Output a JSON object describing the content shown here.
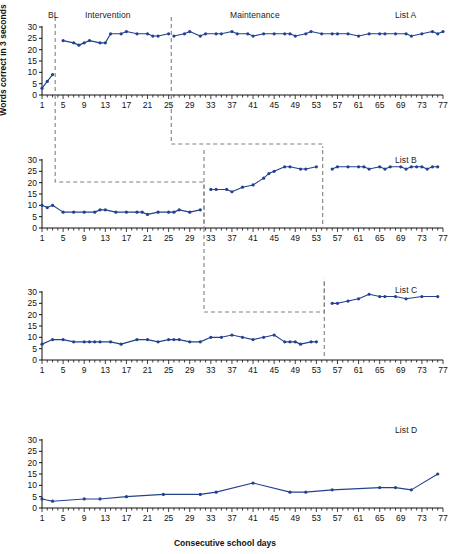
{
  "figure": {
    "ylabel": "Words correct in 3 seconds",
    "xlabel": "Consecutive school days",
    "series_color": "#23418f",
    "axis_color": "#111111",
    "phase_line_color": "#808080"
  },
  "phase_headers": {
    "baseline": "BL",
    "intervention": "Intervention",
    "maintenance": "Maintenance"
  },
  "panel_labels": {
    "a": "List A",
    "b": "List B",
    "c": "List C",
    "d": "List D"
  },
  "axis": {
    "y_ticks": [
      "0",
      "5",
      "10",
      "15",
      "20",
      "25",
      "30"
    ],
    "x_ticks": [
      "1",
      "5",
      "9",
      "13",
      "17",
      "21",
      "25",
      "29",
      "33",
      "37",
      "41",
      "45",
      "49",
      "53",
      "57",
      "61",
      "65",
      "69",
      "73",
      "77"
    ],
    "xlim": [
      1,
      77
    ],
    "ylim": [
      0,
      30
    ]
  },
  "chart_data": {
    "type": "line",
    "title": "",
    "xlabel": "Consecutive school days",
    "ylabel": "Words correct in 3 seconds",
    "xlim": [
      1,
      77
    ],
    "ylim": [
      0,
      30
    ],
    "grid": false,
    "legend": "none",
    "x_tick_labels": [
      "1",
      "5",
      "9",
      "13",
      "17",
      "21",
      "25",
      "29",
      "33",
      "37",
      "41",
      "45",
      "49",
      "53",
      "57",
      "61",
      "65",
      "69",
      "73",
      "77"
    ],
    "y_tick_labels": [
      "0",
      "5",
      "10",
      "15",
      "20",
      "25",
      "30"
    ],
    "panels": [
      {
        "name": "List A",
        "phases": [
          {
            "label": "BL",
            "start_day": 1,
            "end_day": 3
          },
          {
            "label": "Intervention",
            "start_day": 4,
            "end_day": 25
          },
          {
            "label": "Maintenance",
            "start_day": 26,
            "end_day": 77
          }
        ],
        "phase_lines_at": [
          3.5,
          25.5
        ],
        "series": [
          {
            "name": "List A words correct",
            "points": [
              {
                "x": 1,
                "y": 3
              },
              {
                "x": 2,
                "y": 6
              },
              {
                "x": 3,
                "y": 9
              },
              {
                "x": 5,
                "y": 24
              },
              {
                "x": 7,
                "y": 23
              },
              {
                "x": 8,
                "y": 22
              },
              {
                "x": 9,
                "y": 23
              },
              {
                "x": 10,
                "y": 24
              },
              {
                "x": 12,
                "y": 23
              },
              {
                "x": 13,
                "y": 23
              },
              {
                "x": 14,
                "y": 27
              },
              {
                "x": 16,
                "y": 27
              },
              {
                "x": 17,
                "y": 28
              },
              {
                "x": 19,
                "y": 27
              },
              {
                "x": 21,
                "y": 27
              },
              {
                "x": 22,
                "y": 26
              },
              {
                "x": 23,
                "y": 26
              },
              {
                "x": 25,
                "y": 27
              },
              {
                "x": 26,
                "y": 26
              },
              {
                "x": 28,
                "y": 27
              },
              {
                "x": 29,
                "y": 28
              },
              {
                "x": 31,
                "y": 26
              },
              {
                "x": 32,
                "y": 27
              },
              {
                "x": 34,
                "y": 27
              },
              {
                "x": 35,
                "y": 27
              },
              {
                "x": 37,
                "y": 28
              },
              {
                "x": 38,
                "y": 27
              },
              {
                "x": 40,
                "y": 27
              },
              {
                "x": 41,
                "y": 26
              },
              {
                "x": 43,
                "y": 27
              },
              {
                "x": 45,
                "y": 27
              },
              {
                "x": 47,
                "y": 27
              },
              {
                "x": 48,
                "y": 27
              },
              {
                "x": 49,
                "y": 26
              },
              {
                "x": 51,
                "y": 27
              },
              {
                "x": 52,
                "y": 28
              },
              {
                "x": 54,
                "y": 27
              },
              {
                "x": 56,
                "y": 27
              },
              {
                "x": 57,
                "y": 27
              },
              {
                "x": 59,
                "y": 27
              },
              {
                "x": 61,
                "y": 26
              },
              {
                "x": 63,
                "y": 27
              },
              {
                "x": 65,
                "y": 27
              },
              {
                "x": 66,
                "y": 27
              },
              {
                "x": 68,
                "y": 27
              },
              {
                "x": 70,
                "y": 27
              },
              {
                "x": 71,
                "y": 26
              },
              {
                "x": 73,
                "y": 27
              },
              {
                "x": 75,
                "y": 28
              },
              {
                "x": 76,
                "y": 27
              },
              {
                "x": 77,
                "y": 28
              }
            ]
          }
        ]
      },
      {
        "name": "List B",
        "phases": [
          {
            "label": "Baseline",
            "start_day": 1,
            "end_day": 31
          },
          {
            "label": "Intervention",
            "start_day": 33,
            "end_day": 53
          },
          {
            "label": "Maintenance",
            "start_day": 56,
            "end_day": 76
          }
        ],
        "phase_lines_at": [
          31.7,
          54.2
        ],
        "series": [
          {
            "name": "List B words correct",
            "points": [
              {
                "x": 1,
                "y": 10
              },
              {
                "x": 2,
                "y": 9
              },
              {
                "x": 3,
                "y": 10
              },
              {
                "x": 5,
                "y": 7
              },
              {
                "x": 7,
                "y": 7
              },
              {
                "x": 9,
                "y": 7
              },
              {
                "x": 11,
                "y": 7
              },
              {
                "x": 12,
                "y": 8
              },
              {
                "x": 13,
                "y": 8
              },
              {
                "x": 15,
                "y": 7
              },
              {
                "x": 17,
                "y": 7
              },
              {
                "x": 19,
                "y": 7
              },
              {
                "x": 20,
                "y": 7
              },
              {
                "x": 21,
                "y": 6
              },
              {
                "x": 23,
                "y": 7
              },
              {
                "x": 25,
                "y": 7
              },
              {
                "x": 26,
                "y": 7
              },
              {
                "x": 27,
                "y": 8
              },
              {
                "x": 29,
                "y": 7
              },
              {
                "x": 31,
                "y": 8
              },
              {
                "x": 33,
                "y": 17
              },
              {
                "x": 34,
                "y": 17
              },
              {
                "x": 36,
                "y": 17
              },
              {
                "x": 37,
                "y": 16
              },
              {
                "x": 39,
                "y": 18
              },
              {
                "x": 41,
                "y": 19
              },
              {
                "x": 43,
                "y": 22
              },
              {
                "x": 44,
                "y": 24
              },
              {
                "x": 45,
                "y": 25
              },
              {
                "x": 47,
                "y": 27
              },
              {
                "x": 48,
                "y": 27
              },
              {
                "x": 50,
                "y": 26
              },
              {
                "x": 51,
                "y": 26
              },
              {
                "x": 53,
                "y": 27
              },
              {
                "x": 56,
                "y": 26
              },
              {
                "x": 57,
                "y": 27
              },
              {
                "x": 59,
                "y": 27
              },
              {
                "x": 61,
                "y": 27
              },
              {
                "x": 62,
                "y": 27
              },
              {
                "x": 63,
                "y": 26
              },
              {
                "x": 65,
                "y": 27
              },
              {
                "x": 66,
                "y": 26
              },
              {
                "x": 67,
                "y": 27
              },
              {
                "x": 69,
                "y": 27
              },
              {
                "x": 70,
                "y": 26
              },
              {
                "x": 71,
                "y": 27
              },
              {
                "x": 72,
                "y": 27
              },
              {
                "x": 73,
                "y": 27
              },
              {
                "x": 74,
                "y": 26
              },
              {
                "x": 75,
                "y": 27
              },
              {
                "x": 76,
                "y": 27
              }
            ]
          }
        ]
      },
      {
        "name": "List C",
        "phases": [
          {
            "label": "Baseline",
            "start_day": 1,
            "end_day": 53
          },
          {
            "label": "Intervention",
            "start_day": 56,
            "end_day": 77
          }
        ],
        "phase_lines_at": [
          54.5
        ],
        "series": [
          {
            "name": "List C words correct",
            "points": [
              {
                "x": 1,
                "y": 7
              },
              {
                "x": 3,
                "y": 9
              },
              {
                "x": 5,
                "y": 9
              },
              {
                "x": 7,
                "y": 8
              },
              {
                "x": 9,
                "y": 8
              },
              {
                "x": 10,
                "y": 8
              },
              {
                "x": 11,
                "y": 8
              },
              {
                "x": 12,
                "y": 8
              },
              {
                "x": 14,
                "y": 8
              },
              {
                "x": 16,
                "y": 7
              },
              {
                "x": 19,
                "y": 9
              },
              {
                "x": 21,
                "y": 9
              },
              {
                "x": 23,
                "y": 8
              },
              {
                "x": 25,
                "y": 9
              },
              {
                "x": 26,
                "y": 9
              },
              {
                "x": 27,
                "y": 9
              },
              {
                "x": 29,
                "y": 8
              },
              {
                "x": 31,
                "y": 8
              },
              {
                "x": 33,
                "y": 10
              },
              {
                "x": 35,
                "y": 10
              },
              {
                "x": 37,
                "y": 11
              },
              {
                "x": 39,
                "y": 10
              },
              {
                "x": 41,
                "y": 9
              },
              {
                "x": 43,
                "y": 10
              },
              {
                "x": 45,
                "y": 11
              },
              {
                "x": 47,
                "y": 8
              },
              {
                "x": 48,
                "y": 8
              },
              {
                "x": 49,
                "y": 8
              },
              {
                "x": 50,
                "y": 7
              },
              {
                "x": 52,
                "y": 8
              },
              {
                "x": 53,
                "y": 8
              },
              {
                "x": 56,
                "y": 25
              },
              {
                "x": 57,
                "y": 25
              },
              {
                "x": 59,
                "y": 26
              },
              {
                "x": 61,
                "y": 27
              },
              {
                "x": 63,
                "y": 29
              },
              {
                "x": 65,
                "y": 28
              },
              {
                "x": 66,
                "y": 28
              },
              {
                "x": 68,
                "y": 28
              },
              {
                "x": 70,
                "y": 27
              },
              {
                "x": 73,
                "y": 28
              },
              {
                "x": 76,
                "y": 28
              }
            ]
          }
        ]
      },
      {
        "name": "List D",
        "phases": [],
        "phase_lines_at": [],
        "series": [
          {
            "name": "List D words correct",
            "points": [
              {
                "x": 1,
                "y": 4
              },
              {
                "x": 3,
                "y": 3
              },
              {
                "x": 9,
                "y": 4
              },
              {
                "x": 12,
                "y": 4
              },
              {
                "x": 17,
                "y": 5
              },
              {
                "x": 24,
                "y": 6
              },
              {
                "x": 31,
                "y": 6
              },
              {
                "x": 34,
                "y": 7
              },
              {
                "x": 41,
                "y": 11
              },
              {
                "x": 48,
                "y": 7
              },
              {
                "x": 51,
                "y": 7
              },
              {
                "x": 56,
                "y": 8
              },
              {
                "x": 65,
                "y": 9
              },
              {
                "x": 68,
                "y": 9
              },
              {
                "x": 71,
                "y": 8
              },
              {
                "x": 76,
                "y": 15
              }
            ]
          }
        ]
      }
    ]
  }
}
